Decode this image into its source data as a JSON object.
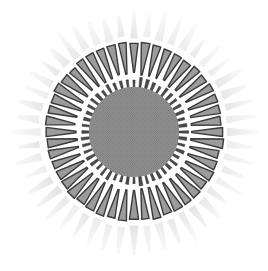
{
  "figure": {
    "title": "Radial sunburst diagram",
    "background_color": "#ffffff",
    "canvas": {
      "width": 268,
      "height": 271
    }
  },
  "chart_data": {
    "type": "pie",
    "title": "",
    "xlabel": "",
    "ylabel": "",
    "legend_position": "none",
    "grid": false,
    "center": {
      "x": 134,
      "y": 132
    },
    "rings": [
      {
        "name": "center-disc",
        "role": "hub",
        "shape": "filled-circle",
        "inner_radius": 0,
        "outer_radius": 45,
        "fill_color": "#8d8d8d",
        "texture": "halftone",
        "count": 1
      },
      {
        "name": "inner-tick-ring",
        "role": "tick-marks",
        "shape": "radial-bars",
        "inner_radius": 44,
        "outer_radius": 55,
        "fill_color": "#4a4a4a",
        "stroke_color": "#2e2e2e",
        "count": 48,
        "angular_width_deg": 3.0,
        "start_angle_deg": -90
      },
      {
        "name": "wedge-ring",
        "role": "primary-segments",
        "shape": "tapered-wedges",
        "inner_radius": 57,
        "outer_radius": 90,
        "fill_color": "#9b9b9b",
        "stroke_color": "#3a3a3a",
        "stroke_width": 1.4,
        "count": 48,
        "angular_width_deg": 5.4,
        "taper": "wide-outer-narrow-inner",
        "start_angle_deg": -90
      },
      {
        "name": "outer-ray-halo",
        "role": "rays",
        "shape": "tapered-rays",
        "inner_radius": 93,
        "outer_radius": 126,
        "fill_color": "#cfcfcf",
        "opacity": 0.55,
        "count": 48,
        "angular_width_deg": 4.6,
        "taper": "wide-inner-narrow-outer",
        "start_angle_deg": -90
      }
    ],
    "categories": [],
    "values": [],
    "palette": {
      "hub_gray": "#8d8d8d",
      "tick_dark": "#4a4a4a",
      "wedge_fill": "#9b9b9b",
      "wedge_outline": "#3a3a3a",
      "ray_light": "#cfcfcf",
      "background": "#ffffff"
    }
  }
}
